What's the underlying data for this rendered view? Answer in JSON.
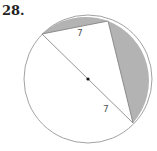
{
  "problem_number": "28.",
  "diagram": {
    "circle": {
      "cx": 88,
      "cy": 79,
      "r": 64
    },
    "points": {
      "A": [
        42,
        34
      ],
      "B": [
        108,
        21
      ],
      "C": [
        133,
        123
      ]
    },
    "center_dot": [
      88,
      79
    ],
    "labels": {
      "chord_AB": "7",
      "diameter_half": "7"
    },
    "colors": {
      "shade": "#b3b3b3",
      "stroke": "#8a8a8a"
    }
  }
}
